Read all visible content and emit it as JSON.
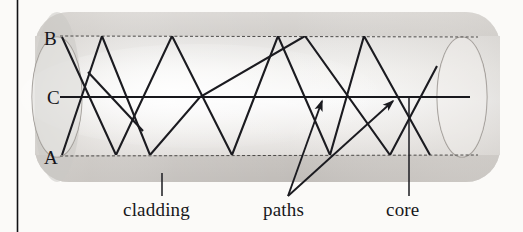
{
  "figure": {
    "kind": "optical-fiber-cross-section-diagram",
    "background_color": "#fbfaf8",
    "ray_color": "#1b1b20",
    "cladding_fill": "#c9c6c2",
    "core_fill": "#eceae7",
    "boundary_stroke": "#4c4a48"
  },
  "axis_labels": [
    {
      "id": "B",
      "text": "B",
      "x": 46,
      "y": 44
    },
    {
      "id": "C",
      "text": "C",
      "x": 49,
      "y": 104
    },
    {
      "id": "A",
      "text": "A",
      "x": 46,
      "y": 163
    }
  ],
  "callouts": [
    {
      "id": "cladding",
      "text": "cladding",
      "x": 123,
      "y": 214
    },
    {
      "id": "paths",
      "text": "paths",
      "x": 263,
      "y": 214
    },
    {
      "id": "core",
      "text": "core",
      "x": 386,
      "y": 214
    }
  ],
  "geometry": {
    "cylinder": {
      "left": 35,
      "right": 500,
      "top": 12,
      "bottom": 182,
      "corner_radius": 34
    },
    "core_band": {
      "top": 36,
      "bottom": 155
    },
    "axis_y": 97,
    "left_cap": {
      "cx": 57,
      "cy": 97,
      "rx": 25,
      "ry": 60
    },
    "right_cap": {
      "cx": 462,
      "cy": 97,
      "rx": 25,
      "ry": 60
    }
  },
  "ray_paths": {
    "axis_ray_C": "M 60 97 L 470 97",
    "ray_from_B": "M 62 37 L 116 155 L 172 36 L 232 155 L 278 36 L 330 155 L 364 36 L 430 155",
    "ray_from_A": "M 62 155 L 102 36 L 150 155 L 200 97 L 305 36 L 390 155 L 437 66",
    "ray_extra": "M 88 72 L 143 131"
  },
  "annotation_arrows": [
    {
      "id": "paths-arrow-left",
      "from_x": 288,
      "from_y": 196,
      "to_x": 322,
      "to_y": 101
    },
    {
      "id": "paths-arrow-right",
      "from_x": 288,
      "from_y": 196,
      "to_x": 393,
      "to_y": 101
    }
  ],
  "leader_lines": [
    {
      "id": "cladding-leader",
      "x1": 162,
      "y1": 172,
      "x2": 162,
      "y2": 196
    },
    {
      "id": "core-leader",
      "x1": 409,
      "y1": 97,
      "x2": 409,
      "y2": 196
    }
  ],
  "page_rule": {
    "x": 17,
    "y1": 0,
    "y2": 232
  }
}
